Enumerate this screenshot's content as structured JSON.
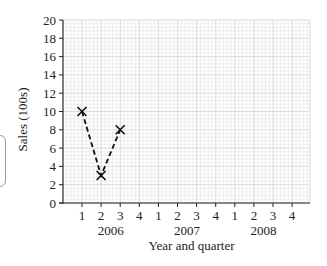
{
  "chart_data": {
    "type": "line",
    "title": "",
    "xlabel": "Year and quarter",
    "ylabel": "Sales (100s)",
    "ylim": [
      0,
      20
    ],
    "yticks": [
      0,
      2,
      4,
      6,
      8,
      10,
      12,
      14,
      16,
      18,
      20
    ],
    "grid": true,
    "legend": null,
    "categories": [
      "1",
      "2",
      "3",
      "4",
      "1",
      "2",
      "3",
      "4",
      "1",
      "2",
      "3",
      "4"
    ],
    "year_groups": [
      {
        "year": "2006",
        "quarters": [
          "1",
          "2",
          "3",
          "4"
        ]
      },
      {
        "year": "2007",
        "quarters": [
          "1",
          "2",
          "3",
          "4"
        ]
      },
      {
        "year": "2008",
        "quarters": [
          "1",
          "2",
          "3",
          "4"
        ]
      }
    ],
    "series": [
      {
        "name": "Sales",
        "marker": "x",
        "line_style": "dashed",
        "points": [
          {
            "year": "2006",
            "quarter": 1,
            "value": 10
          },
          {
            "year": "2006",
            "quarter": 2,
            "value": 3
          },
          {
            "year": "2006",
            "quarter": 3,
            "value": 8
          }
        ]
      }
    ]
  },
  "labels": {
    "ylabel": "Sales (100s)",
    "xlabel": "Year and quarter",
    "years": [
      "2006",
      "2007",
      "2008"
    ]
  }
}
